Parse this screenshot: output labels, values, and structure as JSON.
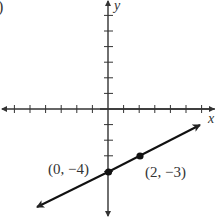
{
  "chart_data": {
    "type": "line",
    "title": "",
    "panel_label": ")",
    "xlabel": "x",
    "ylabel": "y",
    "xlim": [
      -7,
      6
    ],
    "ylim": [
      -5,
      6
    ],
    "grid": false,
    "ticks_x": [
      -6,
      -5,
      -4,
      -3,
      -2,
      -1,
      1,
      2,
      3,
      4,
      5,
      6
    ],
    "ticks_y": [
      -4,
      -3,
      -2,
      -1,
      1,
      2,
      3,
      4,
      5,
      6
    ],
    "series": [
      {
        "name": "line",
        "equation": "y = 0.5x - 4",
        "x": [
          -4.5,
          6
        ],
        "y": [
          -6.25,
          -1
        ],
        "arrows": "both"
      }
    ],
    "points": [
      {
        "x": 0,
        "y": -4,
        "label": "(0, −4)"
      },
      {
        "x": 2,
        "y": -3,
        "label": "(2, −3)"
      }
    ],
    "colors": {
      "axis": "#333333",
      "line": "#111111",
      "text": "#333333"
    }
  }
}
